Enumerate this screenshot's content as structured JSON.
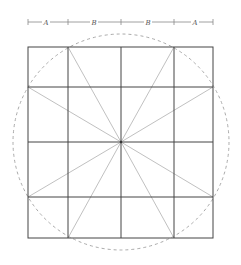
{
  "diagram": {
    "title": "",
    "dimension_labels": [
      "A",
      "B",
      "B",
      "A"
    ],
    "dimension_ticks_x": [
      28,
      68,
      121,
      174,
      213
    ],
    "dimension_line_y": 22,
    "grid": {
      "columns": 4,
      "rows": 4,
      "x_lines": [
        28,
        68,
        121,
        174,
        213
      ],
      "y_lines": [
        47,
        87,
        142,
        197,
        238
      ]
    },
    "center": {
      "x": 121,
      "y": 142
    },
    "circle_radius": 108,
    "rays_to": [
      [
        68,
        47
      ],
      [
        174,
        47
      ],
      [
        213,
        87
      ],
      [
        213,
        197
      ],
      [
        174,
        238
      ],
      [
        68,
        238
      ],
      [
        28,
        197
      ],
      [
        28,
        87
      ]
    ],
    "colors": {
      "grid_line": "#444444",
      "ray_line": "#b0b0b0",
      "circle": "#aaaaaa",
      "dimension_line": "#888888",
      "label": "#555555"
    }
  }
}
